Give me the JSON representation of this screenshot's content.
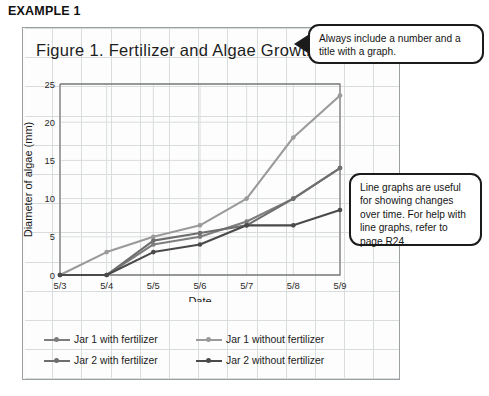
{
  "example_heading": "EXAMPLE 1",
  "chart_title": "Figure 1. Fertilizer and Algae Growth",
  "callouts": [
    {
      "name": "title-advice",
      "text": "Always include a number and a title with a graph."
    },
    {
      "name": "line-graph-advice",
      "text": "Line graphs are useful for showing changes over time. For help with line graphs, refer to page R24."
    }
  ],
  "colors": {
    "series_jar1_without": "#9a9a9a",
    "series_jar1_with": "#7d7d7d",
    "series_jar2_with": "#6e6e6e",
    "series_jar2_without": "#4a4a4a",
    "axis": "#7b7b7b",
    "grid": "#d9dcdd",
    "panel_border": "#9aa0a2",
    "callout_border": "#1b1b1b",
    "text": "#1a1a1a"
  },
  "chart_data": {
    "type": "line",
    "title": "Figure 1. Fertilizer and Algae Growth",
    "xlabel": "Date",
    "ylabel": "Diameter of algae (mm)",
    "categories": [
      "5/3",
      "5/4",
      "5/5",
      "5/6",
      "5/7",
      "5/8",
      "5/9"
    ],
    "yticks": [
      0,
      5,
      10,
      15,
      20,
      25
    ],
    "ylim": [
      0,
      25
    ],
    "grid": true,
    "legend_position": "bottom",
    "series": [
      {
        "name": "Jar 1 with fertilizer",
        "color": "#7d7d7d",
        "values": [
          0,
          0,
          4,
          5,
          7,
          10,
          14
        ]
      },
      {
        "name": "Jar 1 without fertilizer",
        "color": "#9a9a9a",
        "values": [
          0,
          3,
          5,
          6.5,
          10,
          18,
          23.5
        ]
      },
      {
        "name": "Jar 2 with fertilizer",
        "color": "#6e6e6e",
        "values": [
          0,
          0,
          4.5,
          5.5,
          6.5,
          10,
          14
        ]
      },
      {
        "name": "Jar 2 without fertilizer",
        "color": "#4a4a4a",
        "values": [
          0,
          0,
          3,
          4,
          6.5,
          6.5,
          8.5
        ]
      }
    ]
  }
}
